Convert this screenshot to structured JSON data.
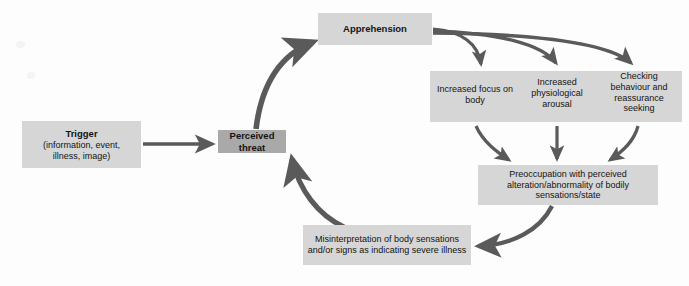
{
  "diagram": {
    "colors": {
      "box_light": "#d6d6d6",
      "box_dark": "#a9a9a9",
      "arrow": "#5a5a5a",
      "text": "#141414",
      "background": "#fdfdfd"
    },
    "nodes": {
      "trigger": {
        "title": "Trigger",
        "detail_line1": "(information, event,",
        "detail_line2": "illness, image)"
      },
      "perceived_threat": {
        "label": "Perceived threat"
      },
      "apprehension": {
        "label": "Apprehension"
      },
      "responses": {
        "increased_focus": "Increased focus on body",
        "increased_arousal": "Increased physiological arousal",
        "checking": "Checking behaviour and reassurance seeking"
      },
      "preoccupation": {
        "label": "Preoccupation with perceived alteration/abnormality of bodily sensations/state"
      },
      "misinterpretation": {
        "label": "Misinterpretation of body sensations and/or signs as indicating severe illness"
      }
    },
    "caption": {
      "text": "",
      "note": "cut off at image edge"
    },
    "icons": {
      "arrow_straight": "arrow-right-icon",
      "arrow_curved": "curved-arrow-icon"
    }
  }
}
